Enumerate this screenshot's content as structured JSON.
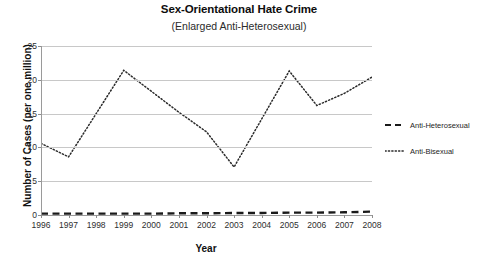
{
  "chart_data": {
    "type": "line",
    "title": "Sex-Orientational Hate Crime",
    "subtitle": "(Enlarged Anti-Heterosexual)",
    "xlabel": "Year",
    "ylabel": "Number of Cases (per one million)",
    "categories": [
      "1996",
      "1997",
      "1998",
      "1999",
      "2000",
      "2001",
      "2002",
      "2003",
      "2004",
      "2005",
      "2006",
      "2007",
      "2008"
    ],
    "x": [
      1996,
      1997,
      1998,
      1999,
      2000,
      2001,
      2002,
      2003,
      2004,
      2005,
      2006,
      2007,
      2008
    ],
    "ylim": [
      0,
      25
    ],
    "xlim": [
      1996,
      2008
    ],
    "yticks": [
      "0",
      "5",
      "10",
      "15",
      "20",
      "25"
    ],
    "ytick_values": [
      0,
      5,
      10,
      15,
      20,
      25
    ],
    "grid": true,
    "legend_position": "right",
    "series": [
      {
        "name": "Anti-Heterosexual",
        "style": "dashed",
        "color": "#1a1a1a",
        "values": [
          0.2,
          0.2,
          0.2,
          0.2,
          0.2,
          0.25,
          0.25,
          0.3,
          0.3,
          0.35,
          0.35,
          0.4,
          0.5
        ]
      },
      {
        "name": "Anti-Bisexual",
        "style": "dotted",
        "color": "#2b2b2b",
        "values": [
          10.6,
          8.6,
          15.0,
          21.4,
          18.3,
          15.2,
          12.3,
          7.1,
          14.2,
          21.3,
          16.2,
          18.0,
          20.4
        ]
      }
    ]
  },
  "legend": {
    "items": [
      {
        "label": "Anti-Heterosexual"
      },
      {
        "label": "Anti-Bisexual"
      }
    ]
  },
  "colors": {
    "gridline": "#c8c8c8",
    "axis": "#9a9a9a",
    "text": "#1a1a1a",
    "background": "#ffffff"
  }
}
